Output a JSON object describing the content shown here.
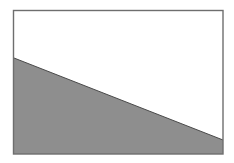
{
  "figure": {
    "background": "#ffffff",
    "frame": {
      "x": 13.5,
      "y": 10.5,
      "width": 209.5,
      "height": 143.5,
      "stroke": "#6e6e6e",
      "stroke_width": 1.4
    },
    "region": {
      "points": "14,58 223,140 223,154 14,154",
      "fill": "#8e8e8e"
    },
    "boundary_line": {
      "x1": 14,
      "y1": 58,
      "x2": 223,
      "y2": 140,
      "stroke": "#4a4a4a",
      "stroke_width": 1
    }
  }
}
